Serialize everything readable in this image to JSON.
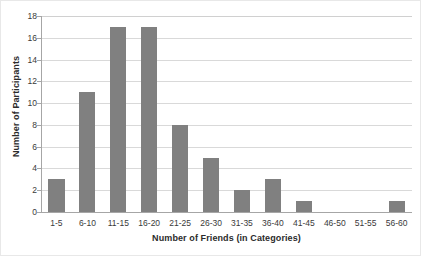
{
  "chart_data": {
    "type": "bar",
    "title": "",
    "subtitle": "",
    "xlabel": "Number of Friends (in Categories)",
    "ylabel": "Number of Participants",
    "categories": [
      "1-5",
      "6-10",
      "11-15",
      "16-20",
      "21-25",
      "26-30",
      "31-35",
      "36-40",
      "41-45",
      "46-50",
      "51-55",
      "56-60"
    ],
    "values": [
      3,
      11,
      17,
      17,
      8,
      5,
      2,
      3,
      1,
      0,
      0,
      1
    ],
    "ylim": [
      0,
      18
    ],
    "ytick_values": [
      0,
      2,
      4,
      6,
      8,
      10,
      12,
      14,
      16,
      18
    ],
    "ytick_labels": [
      "0",
      "2",
      "4",
      "6",
      "8",
      "10",
      "12",
      "14",
      "16",
      "18"
    ],
    "grid": true,
    "grid_axis": "y",
    "legend": false,
    "legend_position": "none",
    "bar_color": "#808080",
    "grid_color": "#d9d9d9",
    "axis_color": "#a6a6a6",
    "background_color": "#ffffff"
  }
}
